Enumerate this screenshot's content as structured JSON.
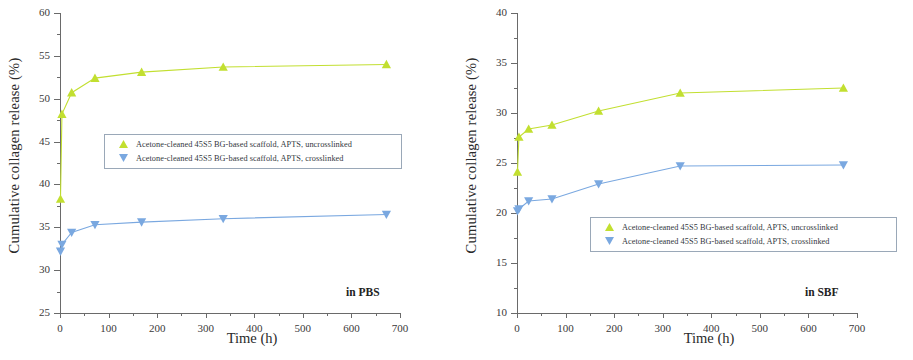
{
  "figure": {
    "panel_count": 2,
    "shared_xlabel": "Time (h)",
    "shared_ylabel": "Cumulative collagen release (%)",
    "colors": {
      "series_uncrosslinked": "#c2df30",
      "series_crosslinked": "#7aa8e0",
      "axis": "#6a6a6a",
      "legend_border": "#9aa8b8",
      "text": "#2a2a2a"
    }
  },
  "legend": {
    "entries": [
      {
        "label": "Acetone-cleaned 45S5 BG-based scaffold, APTS, uncrosslinked",
        "marker": "triangle-up-marker",
        "color": "#c2df30"
      },
      {
        "label": "Acetone-cleaned 45S5 BG-based scaffold, APTS, crosslinked",
        "marker": "triangle-down-marker",
        "color": "#7aa8e0"
      }
    ]
  },
  "chart_data": [
    {
      "type": "line",
      "panel": "left",
      "title": "",
      "annotation": "in PBS",
      "xlabel": "Time (h)",
      "ylabel": "Cumulative collagen release (%)",
      "xlim": [
        0,
        700
      ],
      "ylim": [
        25,
        60
      ],
      "xticks": [
        0,
        100,
        200,
        300,
        400,
        500,
        600,
        700
      ],
      "yticks": [
        25,
        30,
        35,
        40,
        45,
        50,
        55,
        60
      ],
      "xtick_labels": [
        "0",
        "100",
        "200",
        "300",
        "400",
        "500",
        "600",
        "700"
      ],
      "ytick_labels": [
        "25",
        "30",
        "35",
        "40",
        "45",
        "50",
        "55",
        "60"
      ],
      "minor_ticks": true,
      "grid": false,
      "legend_position": "center-left",
      "series": [
        {
          "name": "Acetone-cleaned 45S5 BG-based scaffold, APTS, uncrosslinked",
          "color": "#c2df30",
          "marker": "triangle-up",
          "x": [
            1,
            4,
            24,
            72,
            168,
            336,
            672
          ],
          "y": [
            38.3,
            48.2,
            50.7,
            52.4,
            53.1,
            53.7,
            54.0
          ]
        },
        {
          "name": "Acetone-cleaned 45S5 BG-based scaffold, APTS, crosslinked",
          "color": "#7aa8e0",
          "marker": "triangle-down",
          "x": [
            1,
            4,
            24,
            72,
            168,
            336,
            672
          ],
          "y": [
            32.2,
            33.0,
            34.4,
            35.3,
            35.6,
            36.0,
            36.5
          ]
        }
      ]
    },
    {
      "type": "line",
      "panel": "right",
      "title": "",
      "annotation": "in SBF",
      "xlabel": "Time (h)",
      "ylabel": "Cumulative collagen release (%)",
      "xlim": [
        0,
        700
      ],
      "ylim": [
        10,
        40
      ],
      "xticks": [
        0,
        100,
        200,
        300,
        400,
        500,
        600,
        700
      ],
      "yticks": [
        10,
        15,
        20,
        25,
        30,
        35,
        40
      ],
      "xtick_labels": [
        "0",
        "100",
        "200",
        "300",
        "400",
        "500",
        "600",
        "700"
      ],
      "ytick_labels": [
        "10",
        "15",
        "20",
        "25",
        "30",
        "35",
        "40"
      ],
      "minor_ticks": true,
      "grid": false,
      "legend_position": "lower-right",
      "series": [
        {
          "name": "Acetone-cleaned 45S5 BG-based scaffold, APTS, uncrosslinked",
          "color": "#c2df30",
          "marker": "triangle-up",
          "x": [
            1,
            4,
            24,
            72,
            168,
            336,
            672
          ],
          "y": [
            24.1,
            27.6,
            28.4,
            28.8,
            30.2,
            32.0,
            32.5
          ]
        },
        {
          "name": "Acetone-cleaned 45S5 BG-based scaffold, APTS, crosslinked",
          "color": "#7aa8e0",
          "marker": "triangle-down",
          "x": [
            1,
            4,
            24,
            72,
            168,
            336,
            672
          ],
          "y": [
            20.2,
            20.4,
            21.2,
            21.4,
            22.9,
            24.7,
            24.8
          ]
        }
      ]
    }
  ]
}
